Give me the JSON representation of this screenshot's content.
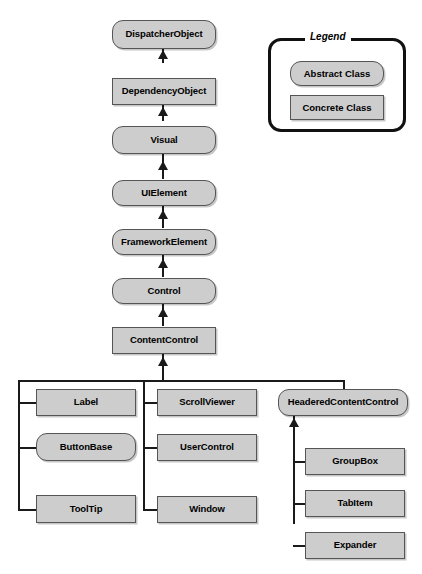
{
  "diagram": {
    "type": "uml-class-hierarchy",
    "colors": {
      "node_fill": "#cdcdcd",
      "node_border": "#555555",
      "connector": "#1a1a1a",
      "background": "#ffffff",
      "legend_border": "#111111"
    }
  },
  "legend": {
    "title": "Legend",
    "items": [
      {
        "label": "Abstract Class",
        "style": "abstract",
        "shape": "rounded-rectangle"
      },
      {
        "label": "Concrete Class",
        "style": "concrete",
        "shape": "rectangle"
      }
    ]
  },
  "spine": {
    "nodes": [
      {
        "label": "DispatcherObject",
        "style": "abstract"
      },
      {
        "label": "DependencyObject",
        "style": "concrete"
      },
      {
        "label": "Visual",
        "style": "abstract"
      },
      {
        "label": "UIElement",
        "style": "abstract"
      },
      {
        "label": "FrameworkElement",
        "style": "abstract"
      },
      {
        "label": "Control",
        "style": "abstract"
      },
      {
        "label": "ContentControl",
        "style": "concrete"
      }
    ]
  },
  "branches": {
    "column_one": [
      {
        "label": "Label",
        "style": "concrete"
      },
      {
        "label": "ButtonBase",
        "style": "abstract"
      },
      {
        "label": "ToolTip",
        "style": "concrete"
      }
    ],
    "column_two": [
      {
        "label": "ScrollViewer",
        "style": "concrete"
      },
      {
        "label": "UserControl",
        "style": "concrete"
      },
      {
        "label": "Window",
        "style": "concrete"
      }
    ],
    "column_three": [
      {
        "label": "HeaderedContentControl",
        "style": "abstract"
      }
    ],
    "headered_children": [
      {
        "label": "GroupBox",
        "style": "concrete"
      },
      {
        "label": "TabItem",
        "style": "concrete"
      },
      {
        "label": "Expander",
        "style": "concrete"
      }
    ]
  }
}
